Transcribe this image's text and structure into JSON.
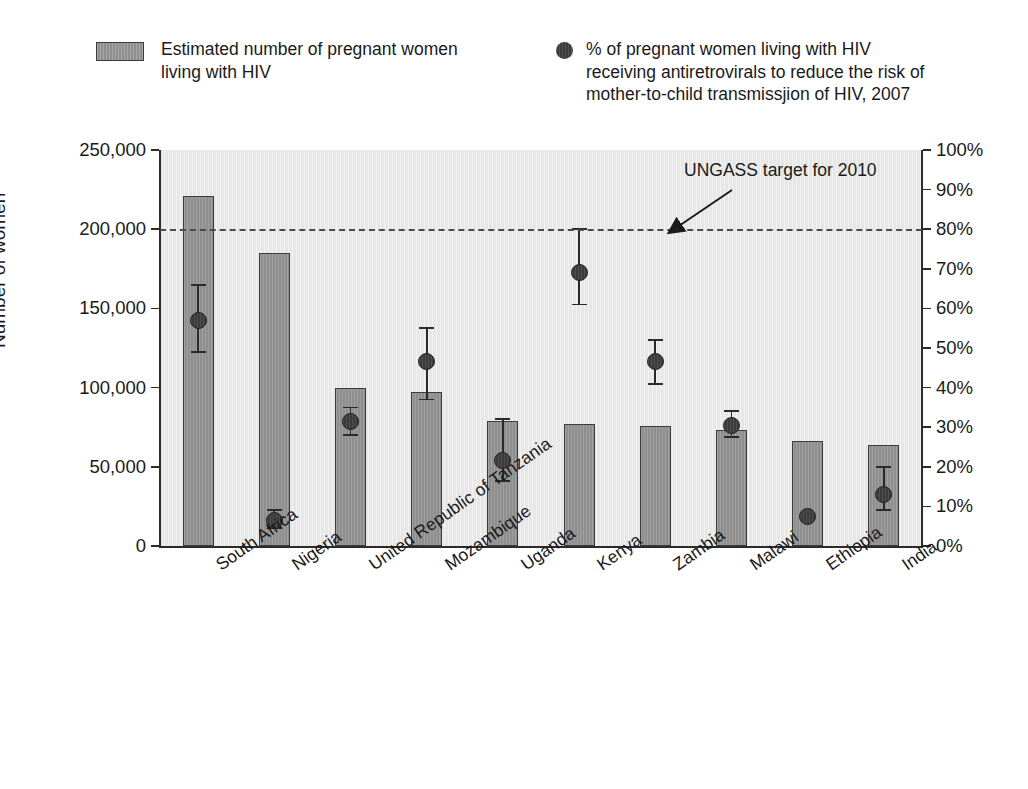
{
  "legend": {
    "bar_series_label": "Estimated number of pregnant women\nliving with HIV",
    "dot_series_label": "% of pregnant women living with HIV\nreceiving antiretrovirals to reduce the risk of\nmother-to-child transmissjion of HIV, 2007",
    "bar_swatch_icon": "filled-rectangle-swatch",
    "dot_swatch_icon": "filled-circle-marker"
  },
  "annotation": {
    "target_label": "UNGASS target for 2010",
    "arrow_icon": "arrow-pointing-down-left"
  },
  "colors": {
    "bar_fill": "#8e8e8e",
    "bar_stroke": "#3c3c3c",
    "dot_fill": "#3c3c3c",
    "plot_background": "#e7e7e7",
    "axis": "#2b2b2b",
    "target_line": "#4a4a4a"
  },
  "chart_data": {
    "type": "bar",
    "title": "",
    "subtitle": "",
    "xlabel": "",
    "ylabel": "Number of women",
    "ylabel_right": "",
    "grid": false,
    "legend_position": "top",
    "categories": [
      "South Africa",
      "Nigeria",
      "United Republic of Tanzania",
      "Mozambique",
      "Uganda",
      "Kenya",
      "Zambia",
      "Malawi",
      "Ethiopia",
      "India"
    ],
    "ylim": [
      0,
      250000
    ],
    "yticks": [
      0,
      50000,
      100000,
      150000,
      200000,
      250000
    ],
    "ytick_labels": [
      "0",
      "50,000",
      "100,000",
      "150,000",
      "200,000",
      "250,000"
    ],
    "ylim_right": [
      0,
      100
    ],
    "yticks_right": [
      0,
      10,
      20,
      30,
      40,
      50,
      60,
      70,
      80,
      90,
      100
    ],
    "ytick_labels_right": [
      "0%",
      "10%",
      "20%",
      "30%",
      "40%",
      "50%",
      "60%",
      "70%",
      "80%",
      "90%",
      "100%"
    ],
    "series": [
      {
        "name": "Estimated number of pregnant women living with HIV",
        "type": "bar",
        "axis": "left",
        "values": [
          221000,
          185000,
          100000,
          97000,
          79000,
          77000,
          76000,
          73000,
          66000,
          64000
        ]
      },
      {
        "name": "% of pregnant women living with HIV receiving antiretrovirals to reduce the risk of mother-to-child transmissjion of HIV, 2007",
        "type": "scatter",
        "axis": "right",
        "values": [
          57.0,
          6.5,
          31.5,
          46.5,
          21.5,
          69.0,
          46.5,
          30.5,
          7.5,
          13.0
        ],
        "error_low": [
          49.0,
          4.5,
          28.0,
          37.0,
          16.5,
          61.0,
          41.0,
          27.5,
          7.5,
          9.0
        ],
        "error_high": [
          66.0,
          9.0,
          35.0,
          55.0,
          32.0,
          80.0,
          52.0,
          34.0,
          7.5,
          20.0
        ]
      }
    ],
    "reference_lines": [
      {
        "label": "UNGASS target for 2010",
        "value_right_axis": 80,
        "value_left_axis": 200000,
        "style": "dashed"
      }
    ]
  }
}
